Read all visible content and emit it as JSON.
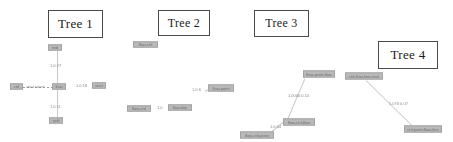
{
  "canvas": {
    "width": 453,
    "height": 142,
    "background": "#ffffff",
    "node_fill": "#b9b9b9",
    "node_border": "#a2a2a2",
    "edge_color": "#c9c9c9",
    "box_border": "#4a4a4a",
    "text_color": "#1a1a1a"
  },
  "tree_boxes": [
    {
      "label": "Tree 1",
      "x": 48,
      "y": 10,
      "w": 55,
      "h": 28,
      "font_size": 13
    },
    {
      "label": "Tree 2",
      "x": 158,
      "y": 10,
      "w": 52,
      "h": 26,
      "font_size": 12
    },
    {
      "label": "Tree 3",
      "x": 254,
      "y": 10,
      "w": 55,
      "h": 27,
      "font_size": 12
    },
    {
      "label": "Tree 4",
      "x": 378,
      "y": 41,
      "w": 60,
      "h": 28,
      "font_size": 13
    }
  ],
  "nodes": [
    {
      "id": "t1-top",
      "label": "mid",
      "x": 48,
      "y": 44,
      "w": 14,
      "h": 7,
      "font_size": 4
    },
    {
      "id": "t1-center",
      "label": "flow",
      "x": 52,
      "y": 83,
      "w": 14,
      "h": 7,
      "font_size": 4
    },
    {
      "id": "t1-left",
      "label": "ctrl",
      "x": 10,
      "y": 83,
      "w": 13,
      "h": 7,
      "font_size": 4
    },
    {
      "id": "t1-right",
      "label": "start",
      "x": 92,
      "y": 82,
      "w": 14,
      "h": 7,
      "font_size": 4
    },
    {
      "id": "t1-bottom",
      "label": "split",
      "x": 49,
      "y": 117,
      "w": 14,
      "h": 7,
      "font_size": 4
    },
    {
      "id": "t2-top",
      "label": "flow-ctrl",
      "x": 133,
      "y": 41,
      "w": 25,
      "h": 7,
      "font_size": 4
    },
    {
      "id": "t2-left",
      "label": "flow-ctrl",
      "x": 127,
      "y": 105,
      "w": 24,
      "h": 7,
      "font_size": 4
    },
    {
      "id": "t2-mid",
      "label": "flow-line",
      "x": 168,
      "y": 104,
      "w": 24,
      "h": 7,
      "font_size": 4
    },
    {
      "id": "t2-right",
      "label": "flow-point",
      "x": 208,
      "y": 84,
      "w": 26,
      "h": 8,
      "font_size": 4
    },
    {
      "id": "t3-top",
      "label": "flow-point-flow",
      "x": 303,
      "y": 70,
      "w": 32,
      "h": 8,
      "font_size": 4
    },
    {
      "id": "t3-mid",
      "label": "flow-ctrl-flow",
      "x": 283,
      "y": 118,
      "w": 32,
      "h": 8,
      "font_size": 4
    },
    {
      "id": "t3-bottom",
      "label": "flow-ctrl-point",
      "x": 240,
      "y": 131,
      "w": 34,
      "h": 8,
      "font_size": 4
    },
    {
      "id": "t4-left",
      "label": "ctrl-flow-line-start",
      "x": 345,
      "y": 72,
      "w": 38,
      "h": 8,
      "font_size": 4
    },
    {
      "id": "t4-right",
      "label": "ctrl-point-flow-line",
      "x": 404,
      "y": 125,
      "w": 38,
      "h": 8,
      "font_size": 4
    }
  ],
  "edge_labels": [
    {
      "id": "t1-e-top",
      "text": "1.0:27",
      "x": 50,
      "y": 63,
      "font_size": 4
    },
    {
      "id": "t1-e-left",
      "text": "start:count",
      "x": 26,
      "y": 84,
      "font_size": 4
    },
    {
      "id": "t1-e-right",
      "text": "1.0:18",
      "x": 76,
      "y": 83,
      "font_size": 4
    },
    {
      "id": "t1-e-bottom",
      "text": "1.0:11",
      "x": 50,
      "y": 104,
      "font_size": 4
    },
    {
      "id": "t2-e-mid",
      "text": "1.0",
      "x": 157,
      "y": 105,
      "font_size": 4
    },
    {
      "id": "t2-e-right",
      "text": "1.0:6",
      "x": 192,
      "y": 87,
      "font_size": 4
    },
    {
      "id": "t3-e-top",
      "text": "1.0000:0.10",
      "x": 288,
      "y": 93,
      "font_size": 4
    },
    {
      "id": "t3-e-bottom",
      "text": "1.0:04",
      "x": 270,
      "y": 124,
      "font_size": 4
    },
    {
      "id": "t4-e",
      "text": "1.076:0.07",
      "x": 389,
      "y": 101,
      "font_size": 4
    }
  ],
  "edges": [
    {
      "id": "t1-vertical-top",
      "type": "v",
      "x": 57,
      "y": 51,
      "len": 33
    },
    {
      "id": "t1-vertical-bottom",
      "type": "v",
      "x": 57,
      "y": 90,
      "len": 27
    },
    {
      "id": "t1-horizontal-left",
      "type": "dash",
      "x": 23,
      "y": 87,
      "len": 29
    },
    {
      "id": "t3-diagonal",
      "type": "line",
      "x1": 288,
      "y1": 118,
      "x2": 305,
      "y2": 78
    },
    {
      "id": "t3-diagonal-lower",
      "type": "line",
      "x1": 272,
      "y1": 131,
      "x2": 285,
      "y2": 120
    },
    {
      "id": "t4-diagonal",
      "type": "line",
      "x1": 366,
      "y1": 80,
      "x2": 412,
      "y2": 125
    },
    {
      "id": "t2-diagonal",
      "type": "line",
      "x1": 205,
      "y1": 91,
      "x2": 212,
      "y2": 87
    }
  ]
}
